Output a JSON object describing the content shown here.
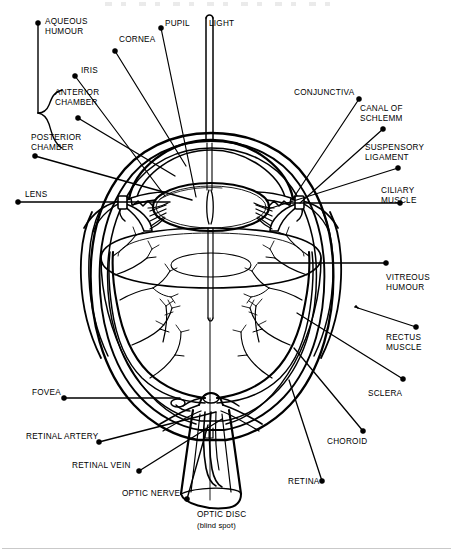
{
  "diagram": {
    "ink_color": "#000000",
    "background_color": "#ffffff",
    "width": 453,
    "height": 558
  },
  "labels": {
    "aqueous_humour": "AQUEOUS\nHUMOUR",
    "cornea": "CORNEA",
    "pupil": "PUPIL",
    "light": "LIGHT",
    "iris": "IRIS",
    "anterior_chamber": "ANTERIOR\nCHAMBER",
    "posterior_chamber": "POSTERIOR\nCHAMBER",
    "lens": "LENS",
    "conjunctiva": "CONJUNCTIVA",
    "canal_of_schlemm": "CANAL OF\nSCHLEMM",
    "suspensory_ligament": "SUSPENSORY\nLIGAMENT",
    "ciliary_muscle": "CILIARY\nMUSCLE",
    "vitreous_humour": "VITREOUS\nHUMOUR",
    "rectus_muscle": "RECTUS\nMUSCLE",
    "sclera": "SCLERA",
    "choroid": "CHOROID",
    "retina": "RETINA",
    "fovea": "FOVEA",
    "retinal_artery": "RETINAL ARTERY",
    "retinal_vein": "RETINAL VEIN",
    "optic_nerve": "OPTIC NERVE",
    "optic_disc": "OPTIC DISC",
    "optic_disc_sub": "(blind spot)"
  },
  "structures": [
    "cornea",
    "anterior chamber",
    "posterior chamber",
    "iris",
    "pupil",
    "lens",
    "suspensory ligament",
    "ciliary muscle",
    "canal of Schlemm",
    "conjunctiva",
    "sclera",
    "choroid",
    "retina",
    "vitreous humour",
    "fovea",
    "optic disc",
    "optic nerve",
    "retinal artery",
    "retinal vein",
    "rectus muscle"
  ]
}
